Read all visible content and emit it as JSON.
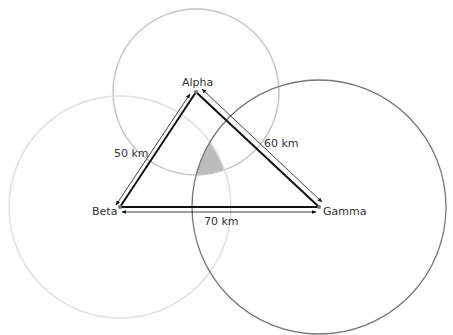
{
  "diagram": {
    "type": "trilateration",
    "colors": {
      "alpha_circle": "#c6c6c6",
      "beta_circle": "#e0e0e0",
      "gamma_circle": "#777777",
      "intersection_fill": "#bcbcbc",
      "edge": "#111111",
      "point": "#777777"
    },
    "nodes": [
      {
        "id": "alpha",
        "label": "Alpha",
        "x": 196,
        "y": 92,
        "radius": 83
      },
      {
        "id": "beta",
        "label": "Beta",
        "x": 120,
        "y": 207,
        "radius": 111
      },
      {
        "id": "gamma",
        "label": "Gamma",
        "x": 319,
        "y": 207,
        "radius": 127
      }
    ],
    "edges": [
      {
        "from": "alpha",
        "to": "beta",
        "label": "50 km"
      },
      {
        "from": "alpha",
        "to": "gamma",
        "label": "60 km"
      },
      {
        "from": "beta",
        "to": "gamma",
        "label": "70 km"
      }
    ]
  }
}
